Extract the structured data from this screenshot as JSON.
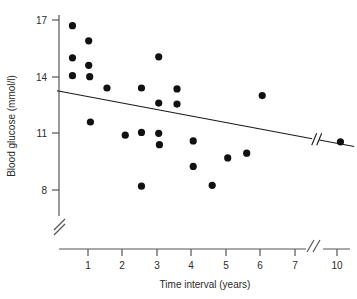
{
  "chart_data": {
    "type": "scatter",
    "title": "",
    "xlabel": "Time interval (years)",
    "ylabel": "Blood glucose (mmol/l)",
    "xticks": [
      1,
      2,
      3,
      4,
      5,
      6,
      7,
      10
    ],
    "xtick_labels": [
      "1",
      "2",
      "3",
      "4",
      "5",
      "6",
      "7",
      "10"
    ],
    "yticks": [
      8,
      11,
      14,
      17
    ],
    "ytick_labels": [
      "8",
      "11",
      "14",
      "17"
    ],
    "xlim": [
      0,
      10.6
    ],
    "ylim": [
      7.0,
      17.6
    ],
    "x_axis_break": true,
    "y_axis_break": true,
    "x_axis_break_between": [
      7,
      10
    ],
    "grid": false,
    "legend": null,
    "marker": "filled-circle",
    "marker_color": "#111111",
    "points": [
      {
        "x": 0.55,
        "y": 16.7
      },
      {
        "x": 0.55,
        "y": 15.0
      },
      {
        "x": 0.55,
        "y": 14.05
      },
      {
        "x": 1.02,
        "y": 15.9
      },
      {
        "x": 1.02,
        "y": 14.6
      },
      {
        "x": 1.05,
        "y": 14.0
      },
      {
        "x": 1.07,
        "y": 11.6
      },
      {
        "x": 1.55,
        "y": 13.4
      },
      {
        "x": 2.08,
        "y": 10.9
      },
      {
        "x": 2.55,
        "y": 13.4
      },
      {
        "x": 2.55,
        "y": 11.05
      },
      {
        "x": 2.55,
        "y": 8.2
      },
      {
        "x": 3.05,
        "y": 15.05
      },
      {
        "x": 3.05,
        "y": 12.6
      },
      {
        "x": 3.05,
        "y": 11.0
      },
      {
        "x": 3.07,
        "y": 10.4
      },
      {
        "x": 3.58,
        "y": 13.35
      },
      {
        "x": 3.58,
        "y": 12.55
      },
      {
        "x": 4.05,
        "y": 10.6
      },
      {
        "x": 4.05,
        "y": 9.25
      },
      {
        "x": 4.6,
        "y": 8.25
      },
      {
        "x": 5.05,
        "y": 9.7
      },
      {
        "x": 5.6,
        "y": 9.95
      },
      {
        "x": 6.05,
        "y": 13.0
      },
      {
        "x": 10.1,
        "y": 10.55
      }
    ],
    "trend_line": {
      "x_start": 0.1,
      "y_start": 13.25,
      "x_end": 10.5,
      "y_end": 10.3,
      "has_break": true,
      "break_x": 7.6
    }
  },
  "annotations": {
    "y_break_symbol": "//",
    "x_break_symbol": "//",
    "trend_break_symbol": "//"
  }
}
